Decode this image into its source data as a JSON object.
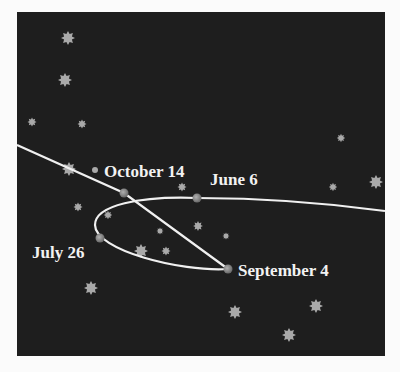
{
  "diagram": {
    "background_color": "#1e1e1e",
    "path_color": "#f0f0f0",
    "labels": {
      "october": "October 14",
      "june": "June 6",
      "july": "July 26",
      "september": "September 4"
    },
    "planet_positions": [
      {
        "date": "June 6",
        "x": 197,
        "y": 198
      },
      {
        "date": "July 26",
        "x": 100,
        "y": 238
      },
      {
        "date": "September 4",
        "x": 228,
        "y": 269
      },
      {
        "date": "October 14",
        "x": 124,
        "y": 193
      }
    ]
  }
}
